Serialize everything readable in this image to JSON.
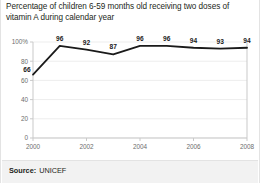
{
  "figure": {
    "title": "Percentage of children 6-59 months old receiving two doses of vitamin A during calendar year",
    "source_label": "Source:",
    "source_value": "UNICEF",
    "line_color": "#1a1a1a",
    "grid_color": "#ededed",
    "axis_color": "#c9c9c9",
    "tick_text_color": "#6d6d6d",
    "band_color": "#f2f2f2"
  },
  "chart_data": {
    "type": "line",
    "title": "Percentage of children 6-59 months old receiving two doses of vitamin A during calendar year",
    "xlabel": "",
    "ylabel": "",
    "x": [
      2000,
      2001,
      2002,
      2003,
      2004,
      2005,
      2006,
      2007,
      2008
    ],
    "values": [
      66,
      96,
      92,
      87,
      96,
      96,
      94,
      93,
      94
    ],
    "point_labels": [
      "66",
      "96",
      "92",
      "87",
      "96",
      "96",
      "94",
      "93",
      "94"
    ],
    "ylim": [
      0,
      100
    ],
    "xlim": [
      2000,
      2008
    ],
    "y_ticks": [
      0,
      20,
      40,
      60,
      80,
      100
    ],
    "y_tick_labels": [
      "0",
      "20",
      "40",
      "60",
      "80",
      "100%"
    ],
    "x_ticks": [
      2000,
      2002,
      2004,
      2006,
      2008
    ],
    "x_tick_labels": [
      "2000",
      "2002",
      "2004",
      "2006",
      "2008"
    ],
    "grid": true,
    "legend": null,
    "series": [
      {
        "name": "Vitamin A two-dose coverage",
        "values": [
          66,
          96,
          92,
          87,
          96,
          96,
          94,
          93,
          94
        ]
      }
    ]
  }
}
